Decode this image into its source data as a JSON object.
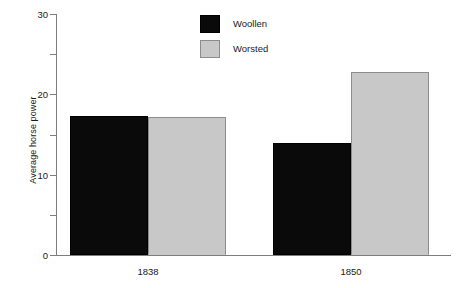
{
  "chart_data": {
    "type": "bar",
    "title": "",
    "xlabel": "",
    "ylabel": "Average horse power",
    "categories": [
      "1838",
      "1850"
    ],
    "series": [
      {
        "name": "Woollen",
        "color": "#0a0a0a",
        "values": [
          17.3,
          13.9
        ]
      },
      {
        "name": "Worsted",
        "color": "#c8c8c8",
        "values": [
          17.2,
          22.8
        ]
      }
    ],
    "ylim": [
      0,
      30
    ],
    "yticks": [
      0,
      10,
      20,
      30
    ],
    "ytick_labels": [
      "0",
      "10",
      "20",
      "30"
    ],
    "yminorticks": [
      5,
      15,
      25
    ],
    "grid": false,
    "legend_position": "top-center"
  },
  "axes": {
    "y_title": "Average horse power",
    "y_labels": [
      "30",
      "20",
      "10",
      "0"
    ],
    "x_labels": [
      "1838",
      "1850"
    ]
  },
  "legend": {
    "items": [
      {
        "label": "Woollen",
        "color": "#0a0a0a"
      },
      {
        "label": "Worsted",
        "color": "#c8c8c8"
      }
    ]
  },
  "colors": {
    "woollen": "#0a0a0a",
    "worsted": "#c8c8c8",
    "axis": "#7d7d7d",
    "background": "#ffffff"
  }
}
